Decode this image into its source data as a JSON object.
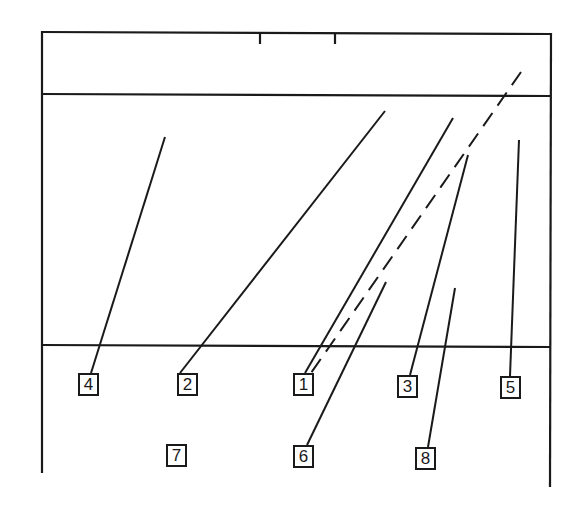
{
  "diagram": {
    "type": "labeled-cross-section",
    "colors": {
      "ink": "#1a1a1a",
      "background": "#ffffff"
    },
    "frame": {
      "left_x": 42,
      "right_x": 551,
      "top_y": 32,
      "left_bottom_y": 473,
      "right_bottom_y": 487,
      "upper_divider_y": 95,
      "lower_divider_y": 346,
      "top_ticks_x": [
        260,
        335
      ]
    },
    "labels": [
      {
        "id": "4",
        "text": "4",
        "x": 78,
        "y": 373
      },
      {
        "id": "2",
        "text": "2",
        "x": 177,
        "y": 373
      },
      {
        "id": "1",
        "text": "1",
        "x": 293,
        "y": 373
      },
      {
        "id": "3",
        "text": "3",
        "x": 397,
        "y": 375
      },
      {
        "id": "5",
        "text": "5",
        "x": 500,
        "y": 376
      },
      {
        "id": "7",
        "text": "7",
        "x": 166,
        "y": 444
      },
      {
        "id": "6",
        "text": "6",
        "x": 293,
        "y": 445
      },
      {
        "id": "8",
        "text": "8",
        "x": 415,
        "y": 447
      }
    ],
    "leaders": [
      {
        "label": "4",
        "x1": 165,
        "y1": 137,
        "x2": 91,
        "y2": 373,
        "style": "solid"
      },
      {
        "label": "2",
        "x1": 385,
        "y1": 111,
        "x2": 180,
        "y2": 373,
        "style": "solid"
      },
      {
        "label": "1",
        "x1": 453,
        "y1": 118,
        "x2": 305,
        "y2": 373,
        "style": "solid"
      },
      {
        "label": "1",
        "x1": 521,
        "y1": 72,
        "x2": 311,
        "y2": 373,
        "style": "dashed"
      },
      {
        "label": "3",
        "x1": 468,
        "y1": 155,
        "x2": 410,
        "y2": 375,
        "style": "solid"
      },
      {
        "label": "5",
        "x1": 519,
        "y1": 140,
        "x2": 510,
        "y2": 376,
        "style": "solid"
      },
      {
        "label": "6",
        "x1": 386,
        "y1": 282,
        "x2": 307,
        "y2": 445,
        "style": "solid"
      },
      {
        "label": "8",
        "x1": 455,
        "y1": 288,
        "x2": 428,
        "y2": 447,
        "style": "solid"
      }
    ]
  }
}
